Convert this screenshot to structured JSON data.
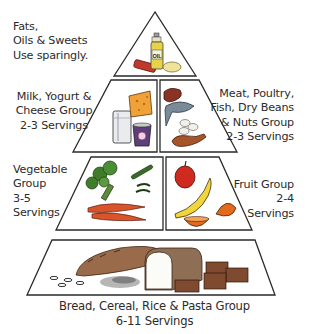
{
  "diagram": {
    "type": "food-pyramid",
    "tiers": [
      {
        "name": "fats-oils-sweets",
        "label_lines": [
          "Fats,",
          "Oils & Sweets",
          "Use sparingly."
        ],
        "illustration": [
          "oil-bottle",
          "candy-bar",
          "butter"
        ],
        "oil_label": "OIL"
      },
      {
        "name": "dairy",
        "label_lines": [
          "Milk, Yogurt &",
          "Cheese Group",
          "2-3 Servings"
        ],
        "illustration": [
          "milk-glass",
          "cheese-wedge",
          "yogurt-cup"
        ]
      },
      {
        "name": "protein",
        "label_lines": [
          "Meat, Poultry,",
          "Fish, Dry Beans",
          "& Nuts Group",
          "2-3 Servings"
        ],
        "illustration": [
          "steak",
          "fish",
          "eggs",
          "nuts",
          "chicken-leg"
        ]
      },
      {
        "name": "vegetable",
        "label_lines": [
          "Vegetable",
          "Group",
          "3-5",
          "Servings"
        ],
        "illustration": [
          "broccoli",
          "green-beans",
          "carrots"
        ]
      },
      {
        "name": "fruit",
        "label_lines": [
          "Fruit Group",
          "2-4",
          "Servings"
        ],
        "illustration": [
          "apple",
          "banana",
          "orange-halves"
        ]
      },
      {
        "name": "grains",
        "label_lines": [
          "Bread, Cereal, Rice & Pasta Group",
          "6-11 Servings"
        ],
        "illustration": [
          "baguette",
          "rice",
          "bread-loaf",
          "crackers",
          "pasta"
        ]
      }
    ],
    "colors": {
      "outline": "#2a2a2a",
      "text": "#2b2b2b",
      "background": "#ffffff"
    }
  }
}
